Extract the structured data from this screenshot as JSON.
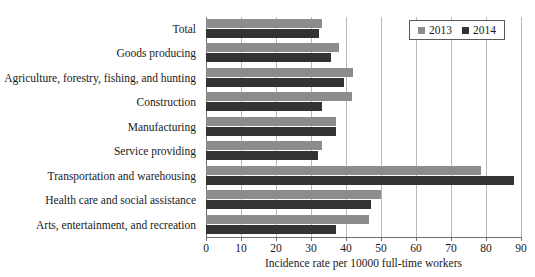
{
  "chart_data": {
    "type": "bar",
    "orientation": "horizontal",
    "title": "",
    "xlabel": "Incidence rate per 10000 full-time workers",
    "ylabel": "",
    "xlim": [
      0,
      90
    ],
    "xticks": [
      0,
      10,
      20,
      30,
      40,
      50,
      60,
      70,
      80,
      90
    ],
    "xticklabels": [
      "0",
      "10",
      "20",
      "30",
      "40",
      "50",
      "60",
      "70",
      "80",
      "90"
    ],
    "grid": "vertical",
    "legend_position": "top-right",
    "categories": [
      "Total",
      "Goods producing",
      "Agriculture, forestry, fishing, and hunting",
      "Construction",
      "Manufacturing",
      "Service providing",
      "Transportation and warehousing",
      "Health care and social assistance",
      "Arts, entertainment, and recreation"
    ],
    "series": [
      {
        "name": "2013",
        "color": "#8c8c8c",
        "values": [
          33.0,
          38.0,
          42.0,
          41.8,
          37.0,
          33.0,
          78.5,
          50.0,
          46.5
        ]
      },
      {
        "name": "2014",
        "color": "#333333",
        "values": [
          32.3,
          35.7,
          39.5,
          33.0,
          37.0,
          32.0,
          88.0,
          47.0,
          37.0
        ]
      }
    ]
  },
  "legend": {
    "items": [
      {
        "label": "2013",
        "color": "#8c8c8c"
      },
      {
        "label": "2014",
        "color": "#333333"
      }
    ]
  },
  "axis": {
    "x_title": "Incidence rate per 10000 full-time workers"
  },
  "colors": {
    "series_2013": "#8c8c8c",
    "series_2014": "#333333",
    "gridline": "#b8b8b8",
    "axis": "#6e6e6e",
    "background": "#ffffff",
    "text": "#1a1a1a"
  }
}
